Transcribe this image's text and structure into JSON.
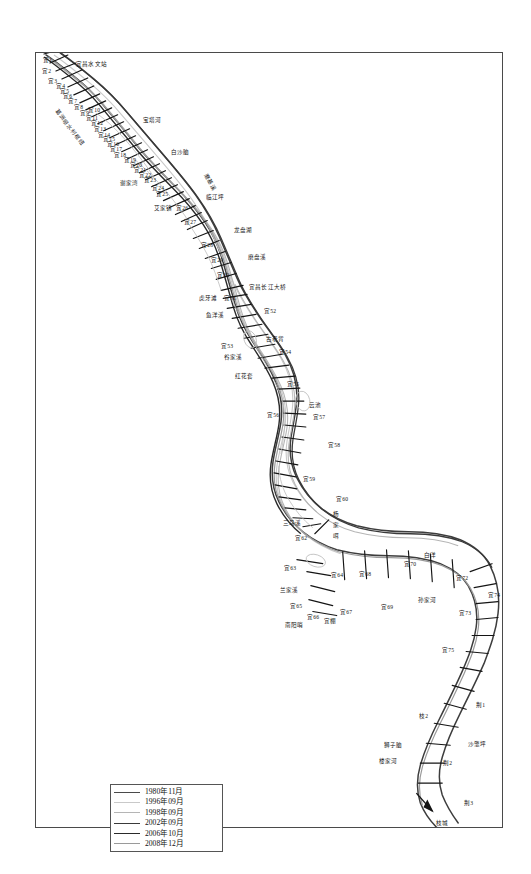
{
  "figure": {
    "kind": "river-channel-plan-map"
  },
  "legend": {
    "title": "",
    "entries": [
      {
        "label": "1980年11月",
        "color": "#4a4a4a",
        "width": "1.6px"
      },
      {
        "label": "1996年09月",
        "color": "#c9c9c9",
        "width": "1.1px"
      },
      {
        "label": "1998年09月",
        "color": "#b5b5b5",
        "width": "1.1px"
      },
      {
        "label": "2002年09月",
        "color": "#3a3a3a",
        "width": "1.5px"
      },
      {
        "label": "2006年10月",
        "color": "#2a2a2a",
        "width": "1.7px"
      },
      {
        "label": "2008年12月",
        "color": "#9a9a9a",
        "width": "1.2px"
      }
    ]
  },
  "map_labels": [
    {
      "id": "l1",
      "text": "宜1",
      "x": 7,
      "y": 5,
      "rot": 0
    },
    {
      "id": "l2",
      "text": "宜2",
      "x": 6,
      "y": 16,
      "rot": 0
    },
    {
      "id": "l3",
      "text": "宜昌水文站",
      "x": 40,
      "y": 9,
      "rot": 0
    },
    {
      "id": "l4",
      "text": "宜3",
      "x": 12,
      "y": 26,
      "rot": 0
    },
    {
      "id": "l5",
      "text": "宜4",
      "x": 20,
      "y": 31,
      "rot": 0
    },
    {
      "id": "l6",
      "text": "宜5",
      "x": 24,
      "y": 36,
      "rot": 0
    },
    {
      "id": "l7",
      "text": "宜6",
      "x": 27,
      "y": 41,
      "rot": 0
    },
    {
      "id": "l8",
      "text": "宜7",
      "x": 32,
      "y": 46,
      "rot": 0
    },
    {
      "id": "l9",
      "text": "宜8",
      "x": 38,
      "y": 52,
      "rot": 0
    },
    {
      "id": "l10",
      "text": "葛洲坝水利枢纽",
      "x": 22,
      "y": 56,
      "rot": 52
    },
    {
      "id": "l11",
      "text": "宜9",
      "x": 44,
      "y": 58,
      "rot": 0
    },
    {
      "id": "l12",
      "text": "宜10",
      "x": 52,
      "y": 55,
      "rot": 0
    },
    {
      "id": "l13",
      "text": "宜11",
      "x": 50,
      "y": 63,
      "rot": 0
    },
    {
      "id": "l14",
      "text": "宜12",
      "x": 55,
      "y": 68,
      "rot": 0
    },
    {
      "id": "l15",
      "text": "宝塔河",
      "x": 107,
      "y": 65,
      "rot": 0
    },
    {
      "id": "l16",
      "text": "宜13",
      "x": 58,
      "y": 74,
      "rot": 0
    },
    {
      "id": "l17",
      "text": "宜14",
      "x": 62,
      "y": 80,
      "rot": 0
    },
    {
      "id": "l18",
      "text": "宜15",
      "x": 67,
      "y": 84,
      "rot": 0
    },
    {
      "id": "l19",
      "text": "宜16",
      "x": 71,
      "y": 89,
      "rot": 0
    },
    {
      "id": "l20",
      "text": "宜17",
      "x": 74,
      "y": 94,
      "rot": 0
    },
    {
      "id": "l21",
      "text": "白沙脑",
      "x": 135,
      "y": 97,
      "rot": 0
    },
    {
      "id": "l22",
      "text": "宜18",
      "x": 78,
      "y": 100,
      "rot": 0
    },
    {
      "id": "l23",
      "text": "宜19",
      "x": 88,
      "y": 105,
      "rot": 0
    },
    {
      "id": "l24",
      "text": "宜20",
      "x": 94,
      "y": 110,
      "rot": 0
    },
    {
      "id": "l25",
      "text": "宜21",
      "x": 98,
      "y": 115,
      "rot": 0
    },
    {
      "id": "l26",
      "text": "宜22",
      "x": 103,
      "y": 120,
      "rot": 0
    },
    {
      "id": "l27",
      "text": "谢家湾",
      "x": 84,
      "y": 128,
      "rot": 0
    },
    {
      "id": "l28",
      "text": "宜23",
      "x": 108,
      "y": 125,
      "rot": 0
    },
    {
      "id": "l29",
      "text": "宜24",
      "x": 116,
      "y": 133,
      "rot": 0
    },
    {
      "id": "l30",
      "text": "宜25",
      "x": 120,
      "y": 139,
      "rot": 0
    },
    {
      "id": "l31",
      "text": "磨基溪",
      "x": 172,
      "y": 120,
      "rot": 62
    },
    {
      "id": "l32",
      "text": "艾家镇",
      "x": 118,
      "y": 153,
      "rot": 0
    },
    {
      "id": "l33",
      "text": "宜26",
      "x": 140,
      "y": 153,
      "rot": 0
    },
    {
      "id": "l34",
      "text": "临江坪",
      "x": 170,
      "y": 142,
      "rot": 0
    },
    {
      "id": "l35",
      "text": "宜27",
      "x": 148,
      "y": 167,
      "rot": 0
    },
    {
      "id": "l36",
      "text": "龙盘湖",
      "x": 198,
      "y": 175,
      "rot": 0
    },
    {
      "id": "l37",
      "text": "宜28",
      "x": 165,
      "y": 190,
      "rot": 0
    },
    {
      "id": "l38",
      "text": "磨盘溪",
      "x": 212,
      "y": 202,
      "rot": 0
    },
    {
      "id": "l39",
      "text": "宜29",
      "x": 175,
      "y": 205,
      "rot": 0
    },
    {
      "id": "l40",
      "text": "宜30",
      "x": 181,
      "y": 220,
      "rot": 0
    },
    {
      "id": "l41",
      "text": "宜昌长江大桥",
      "x": 213,
      "y": 232,
      "rot": 0
    },
    {
      "id": "l42",
      "text": "虎牙滩",
      "x": 163,
      "y": 243,
      "rot": 0
    },
    {
      "id": "l43",
      "text": "宜51",
      "x": 188,
      "y": 243,
      "rot": 0
    },
    {
      "id": "l44",
      "text": "宜52",
      "x": 228,
      "y": 256,
      "rot": 0
    },
    {
      "id": "l45",
      "text": "鱼洋溪",
      "x": 170,
      "y": 260,
      "rot": 0
    },
    {
      "id": "l46",
      "text": "古老背",
      "x": 230,
      "y": 284,
      "rot": 0
    },
    {
      "id": "l47",
      "text": "宜53",
      "x": 185,
      "y": 291,
      "rot": 0
    },
    {
      "id": "l48",
      "text": "谷家溪",
      "x": 188,
      "y": 302,
      "rot": 0
    },
    {
      "id": "l49",
      "text": "宜54",
      "x": 243,
      "y": 297,
      "rot": 0
    },
    {
      "id": "l50",
      "text": "红花套",
      "x": 199,
      "y": 321,
      "rot": 0
    },
    {
      "id": "l51",
      "text": "宜55",
      "x": 251,
      "y": 329,
      "rot": 0
    },
    {
      "id": "l52",
      "text": "云池",
      "x": 273,
      "y": 350,
      "rot": 0
    },
    {
      "id": "l53",
      "text": "宜56",
      "x": 231,
      "y": 360,
      "rot": 0
    },
    {
      "id": "l54",
      "text": "宜57",
      "x": 277,
      "y": 362,
      "rot": 0
    },
    {
      "id": "l55",
      "text": "宜58",
      "x": 292,
      "y": 390,
      "rot": 0
    },
    {
      "id": "l56",
      "text": "宜59",
      "x": 267,
      "y": 424,
      "rot": 0
    },
    {
      "id": "l57",
      "text": "宜60",
      "x": 300,
      "y": 444,
      "rot": 0
    },
    {
      "id": "l58",
      "text": "杨",
      "x": 297,
      "y": 459,
      "rot": 0
    },
    {
      "id": "l59",
      "text": "三马溪",
      "x": 247,
      "y": 468,
      "rot": 0
    },
    {
      "id": "l60",
      "text": "家",
      "x": 297,
      "y": 470,
      "rot": 0
    },
    {
      "id": "l61",
      "text": "宜62",
      "x": 259,
      "y": 483,
      "rot": 0
    },
    {
      "id": "l62",
      "text": "咡",
      "x": 297,
      "y": 481,
      "rot": 0
    },
    {
      "id": "l63",
      "text": "白洋",
      "x": 388,
      "y": 500,
      "rot": 0
    },
    {
      "id": "l64",
      "text": "宜63",
      "x": 248,
      "y": 513,
      "rot": 0
    },
    {
      "id": "l65",
      "text": "宜64",
      "x": 295,
      "y": 520,
      "rot": 0
    },
    {
      "id": "l66",
      "text": "宜68",
      "x": 323,
      "y": 519,
      "rot": 0
    },
    {
      "id": "l67",
      "text": "宜70",
      "x": 368,
      "y": 509,
      "rot": 0
    },
    {
      "id": "l68",
      "text": "宜72",
      "x": 420,
      "y": 523,
      "rot": 0
    },
    {
      "id": "l69",
      "text": "兰家溪",
      "x": 244,
      "y": 535,
      "rot": 0
    },
    {
      "id": "l70",
      "text": "宜65",
      "x": 254,
      "y": 551,
      "rot": 0
    },
    {
      "id": "l71",
      "text": "孙家河",
      "x": 382,
      "y": 545,
      "rot": 0
    },
    {
      "id": "l72",
      "text": "宜66",
      "x": 271,
      "y": 562,
      "rot": 0
    },
    {
      "id": "l73",
      "text": "宜67",
      "x": 304,
      "y": 557,
      "rot": 0
    },
    {
      "id": "l74",
      "text": "宜69",
      "x": 345,
      "y": 552,
      "rot": 0
    },
    {
      "id": "l75",
      "text": "南阳哨",
      "x": 249,
      "y": 570,
      "rot": 0
    },
    {
      "id": "l76",
      "text": "宜棚",
      "x": 288,
      "y": 566,
      "rot": 0
    },
    {
      "id": "l77",
      "text": "宜73",
      "x": 423,
      "y": 558,
      "rot": 0
    },
    {
      "id": "l78",
      "text": "宜74",
      "x": 452,
      "y": 540,
      "rot": 0
    },
    {
      "id": "l79",
      "text": "宜75",
      "x": 406,
      "y": 595,
      "rot": 0
    },
    {
      "id": "l80",
      "text": "荆1",
      "x": 440,
      "y": 650,
      "rot": 0
    },
    {
      "id": "l81",
      "text": "枝2",
      "x": 383,
      "y": 661,
      "rot": 0
    },
    {
      "id": "l82",
      "text": "沙氅坪",
      "x": 432,
      "y": 689,
      "rot": 0
    },
    {
      "id": "l83",
      "text": "狮子脑",
      "x": 348,
      "y": 690,
      "rot": 0
    },
    {
      "id": "l84",
      "text": "荆2",
      "x": 407,
      "y": 708,
      "rot": 0
    },
    {
      "id": "l85",
      "text": "楼家河",
      "x": 343,
      "y": 706,
      "rot": 0
    },
    {
      "id": "l86",
      "text": "荆3",
      "x": 428,
      "y": 748,
      "rot": 0
    },
    {
      "id": "l87",
      "text": "枝城",
      "x": 400,
      "y": 768,
      "rot": 0
    }
  ],
  "chart_data": {
    "type": "map",
    "title": "",
    "river": "长江 (Yangtze River)",
    "reach": "宜昌 — 枝城",
    "cross_section_series": [
      {
        "prefix": "宜",
        "from": 1,
        "to": 75
      },
      {
        "prefix": "枝",
        "from": 1,
        "to": 3
      },
      {
        "prefix": "荆",
        "from": 1,
        "to": 3
      }
    ],
    "survey_dates": [
      "1980年11月",
      "1996年09月",
      "1998年09月",
      "2002年09月",
      "2006年10月",
      "2008年12月"
    ],
    "place_names": [
      "宜昌水文站",
      "葛洲坝水利枢纽",
      "宝塔河",
      "白沙脑",
      "谢家湾",
      "磨基溪",
      "艾家镇",
      "临江坪",
      "龙盘湖",
      "磨盘溪",
      "宜昌长江大桥",
      "虎牙滩",
      "鱼洋溪",
      "古老背",
      "谷家溪",
      "红花套",
      "云池",
      "三马溪",
      "杨家咡",
      "白洋",
      "兰家溪",
      "孙家河",
      "南阳哨",
      "狮子脑",
      "楼家河",
      "沙氅坪",
      "枝城"
    ],
    "legend_position": "bottom-left",
    "grid": false
  }
}
